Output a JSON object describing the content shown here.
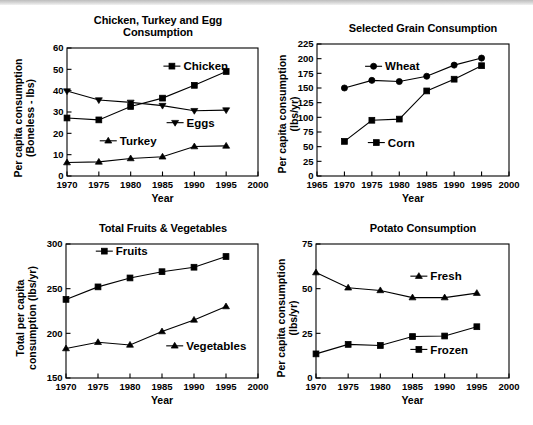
{
  "page": {
    "background": "#ffffff",
    "ink": "#000000",
    "top_band": true
  },
  "charts": [
    {
      "id": "chicken-turkey-egg",
      "title": "Chicken, Turkey and Egg\nConsumption",
      "xlabel": "Year",
      "ylabel": "Per capita consumption\n(Boneless - lbs)",
      "type": "line",
      "x": [
        1970,
        1975,
        1980,
        1985,
        1990,
        1995
      ],
      "xlim": [
        1970,
        2000
      ],
      "xticks": [
        1970,
        1975,
        1980,
        1985,
        1990,
        1995,
        2000
      ],
      "ylim": [
        0,
        60
      ],
      "yticks": [
        0,
        10,
        20,
        30,
        40,
        50,
        60
      ],
      "grid": false,
      "series": [
        {
          "name": "Chicken",
          "marker": "square",
          "values": [
            27.2,
            26.3,
            32.6,
            36.5,
            42.5,
            49.0
          ],
          "label_x": 1987.5,
          "label_y": 51.5
        },
        {
          "name": "Eggs",
          "marker": "triangle-down",
          "values": [
            39.8,
            35.6,
            34.5,
            33.0,
            30.6,
            30.9
          ],
          "label_x": 1988.0,
          "label_y": 25.0
        },
        {
          "name": "Turkey",
          "marker": "triangle-up",
          "values": [
            6.3,
            6.6,
            8.2,
            9.0,
            13.8,
            14.1
          ],
          "label_x": 1977.5,
          "label_y": 16.5
        }
      ]
    },
    {
      "id": "selected-grain",
      "title": "Selected Grain Consumption",
      "xlabel": "Year",
      "ylabel": "Per capita consumption\n(lbs/yr)",
      "type": "line",
      "x": [
        1970,
        1975,
        1980,
        1985,
        1990,
        1995
      ],
      "xlim": [
        1965,
        2000
      ],
      "xticks": [
        1965,
        1970,
        1975,
        1980,
        1985,
        1990,
        1995,
        2000
      ],
      "ylim": [
        0,
        225
      ],
      "yticks": [
        0,
        25,
        50,
        75,
        100,
        125,
        150,
        175,
        200,
        225
      ],
      "grid": false,
      "series": [
        {
          "name": "Wheat",
          "marker": "circle",
          "values": [
            150,
            163,
            161,
            170,
            189,
            201
          ],
          "label_x": 1976.5,
          "label_y": 187
        },
        {
          "name": "Corn",
          "marker": "square",
          "values": [
            59,
            95,
            97,
            145,
            165,
            188
          ],
          "label_x": 1977.0,
          "label_y": 57
        }
      ]
    },
    {
      "id": "total-fruits-vegetables",
      "title": "Total Fruits & Vegetables",
      "xlabel": "Year",
      "ylabel": "Total per capita\nconsumption (lbs/yr)",
      "type": "line",
      "x": [
        1970,
        1975,
        1980,
        1985,
        1990,
        1995
      ],
      "xlim": [
        1970,
        2000
      ],
      "xticks": [
        1970,
        1975,
        1980,
        1985,
        1990,
        1995,
        2000
      ],
      "ylim": [
        150,
        300
      ],
      "yticks": [
        150,
        200,
        250,
        300
      ],
      "grid": false,
      "series": [
        {
          "name": "Fruits",
          "marker": "square",
          "values": [
            238,
            252,
            262,
            269,
            274,
            286
          ],
          "label_x": 1977.0,
          "label_y": 292
        },
        {
          "name": "Vegetables",
          "marker": "triangle-up",
          "values": [
            183,
            190,
            187,
            202,
            215,
            230
          ],
          "label_x": 1988.0,
          "label_y": 186
        }
      ]
    },
    {
      "id": "potato-consumption",
      "title": "Potato Consumption",
      "xlabel": "Year",
      "ylabel": "Per capita consumption\n(lbs/yr)",
      "type": "line",
      "x": [
        1970,
        1975,
        1980,
        1985,
        1990,
        1995
      ],
      "xlim": [
        1970,
        2000
      ],
      "xticks": [
        1970,
        1975,
        1980,
        1985,
        1990,
        1995,
        2000
      ],
      "ylim": [
        0,
        75
      ],
      "yticks": [
        0,
        25,
        50,
        75
      ],
      "grid": false,
      "series": [
        {
          "name": "Fresh",
          "marker": "triangle-up",
          "values": [
            59,
            50.5,
            49,
            45,
            45,
            47.5
          ],
          "label_x": 1987.0,
          "label_y": 57
        },
        {
          "name": "Frozen",
          "marker": "square",
          "values": [
            13.5,
            18.8,
            18.2,
            23.2,
            23.5,
            28.7
          ],
          "label_x": 1987.0,
          "label_y": 16
        }
      ]
    }
  ]
}
